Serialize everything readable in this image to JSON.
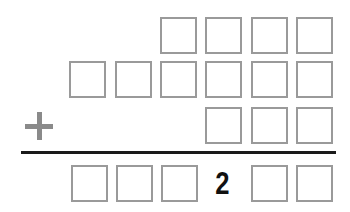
{
  "puzzle": {
    "type": "column-addition",
    "operator": "+",
    "operator_icon": "plus-icon",
    "colors": {
      "box_border": "#9a9a9a",
      "operator": "#8a8a8a",
      "rule": "#1a1a1a",
      "digit": "#111111"
    },
    "rows": [
      {
        "name": "addend-1",
        "cells": [
          "",
          "",
          "",
          ""
        ]
      },
      {
        "name": "addend-2",
        "cells": [
          "",
          "",
          "",
          "",
          "",
          ""
        ]
      },
      {
        "name": "addend-3",
        "cells": [
          "",
          "",
          ""
        ]
      },
      {
        "name": "sum",
        "cells": [
          "",
          "",
          "",
          "2",
          "",
          ""
        ]
      }
    ]
  }
}
